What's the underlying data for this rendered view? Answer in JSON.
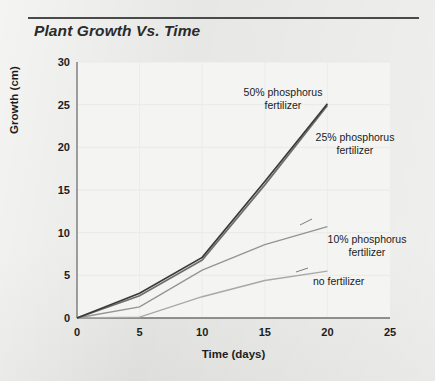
{
  "chart_data": {
    "type": "line",
    "title": "Plant Growth Vs. Time",
    "xlabel": "Time (days)",
    "ylabel": "Growth (cm)",
    "xlim": [
      0,
      25
    ],
    "ylim": [
      0,
      30
    ],
    "xticks": [
      "0",
      "5",
      "10",
      "15",
      "20",
      "25"
    ],
    "yticks": [
      "0",
      "5",
      "10",
      "15",
      "20",
      "25",
      "30"
    ],
    "grid": true,
    "legend_position": "inline-annotations",
    "series": [
      {
        "name": "50% phosphorus fertilizer",
        "label_line1": "50% phosphorus",
        "label_line2": "fertilizer",
        "color": "#3a3a3a",
        "x": [
          0,
          5,
          10,
          15,
          20
        ],
        "values": [
          0,
          2.9,
          7.1,
          16.0,
          25.1
        ]
      },
      {
        "name": "25% phosphorus fertilizer",
        "label_line1": "25% phosphorus",
        "label_line2": "fertilizer",
        "color": "#6d6d6d",
        "x": [
          0,
          5,
          10,
          15,
          20
        ],
        "values": [
          0,
          2.6,
          6.8,
          15.6,
          24.9
        ]
      },
      {
        "name": "10% phosphorus fertilizer",
        "label_line1": "10% phosphorus",
        "label_line2": "fertilizer",
        "color": "#8f8f8f",
        "x": [
          0,
          5,
          10,
          15,
          20
        ],
        "values": [
          0,
          1.3,
          5.6,
          8.6,
          10.7
        ]
      },
      {
        "name": "no fertilizer",
        "label_line1": "no fertilizer",
        "label_line2": "",
        "color": "#a5a5a5",
        "x": [
          0,
          5,
          10,
          15,
          20
        ],
        "values": [
          0,
          0.1,
          2.5,
          4.4,
          5.5
        ]
      }
    ]
  },
  "axes": {
    "y_ticks": [
      {
        "value": "30"
      },
      {
        "value": "25"
      },
      {
        "value": "20"
      },
      {
        "value": "15"
      },
      {
        "value": "10"
      },
      {
        "value": "5"
      },
      {
        "value": "0"
      }
    ],
    "x_ticks": [
      {
        "value": "0"
      },
      {
        "value": "5"
      },
      {
        "value": "10"
      },
      {
        "value": "15"
      },
      {
        "value": "20"
      },
      {
        "value": "25"
      }
    ],
    "y_title": "Growth (cm)",
    "x_title": "Time (days)"
  },
  "annotations": [
    {
      "id": "label-50",
      "line1": "50% phosphorus",
      "line2": "fertilizer"
    },
    {
      "id": "label-25",
      "line1": "25% phosphorus",
      "line2": "fertilizer"
    },
    {
      "id": "label-10",
      "line1": "10% phosphorus",
      "line2": "fertilizer"
    },
    {
      "id": "label-none",
      "line1": "no fertilizer",
      "line2": ""
    }
  ],
  "colors": {
    "page_background": "#e7e7e5",
    "plot_background": "#f4f4f2",
    "axis": "#7a7a7a",
    "title_rule": "#4a4a4a",
    "text": "#1d1d1d"
  }
}
